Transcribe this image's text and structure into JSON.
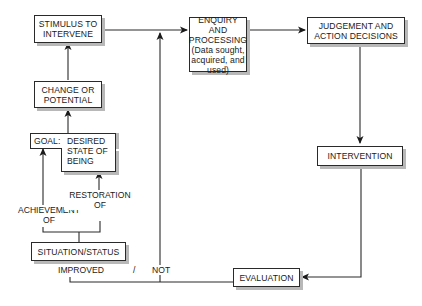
{
  "diagram": {
    "type": "flowchart",
    "nodes": {
      "stimulus": {
        "label": "STIMULUS TO\nINTERVENE"
      },
      "change": {
        "label": "CHANGE OR\nPOTENTIAL"
      },
      "goal": {
        "prefix": "GOAL:",
        "label": "DESIRED\nSTATE OF\nBEING"
      },
      "situation": {
        "label": "SITUATION/STATUS"
      },
      "enquiry": {
        "label": "ENQUIRY AND\nPROCESSING\n(Data sought,\nacquired, and\nused)"
      },
      "judgement": {
        "label": "JUDGEMENT  AND\nACTION DECISIONS"
      },
      "intervention": {
        "label": "INTERVENTION"
      },
      "evaluation": {
        "label": "EVALUATION"
      }
    },
    "edge_labels": {
      "achievement": "ACHIEVEMENT\nOF",
      "restoration": "RESTORATION\nOF",
      "improved": "IMPROVED",
      "slash": "/",
      "not": "NOT"
    },
    "edges": [
      {
        "from": "situation",
        "to": "goal",
        "label": "ACHIEVEMENT OF"
      },
      {
        "from": "situation",
        "to": "goal",
        "label": "RESTORATION OF"
      },
      {
        "from": "goal",
        "to": "change"
      },
      {
        "from": "change",
        "to": "stimulus"
      },
      {
        "from": "stimulus",
        "to": "enquiry"
      },
      {
        "from": "enquiry",
        "to": "judgement"
      },
      {
        "from": "judgement",
        "to": "intervention"
      },
      {
        "from": "intervention",
        "to": "evaluation"
      },
      {
        "from": "evaluation",
        "to": "situation",
        "label": "IMPROVED"
      },
      {
        "from": "evaluation",
        "to": "enquiry",
        "label": "NOT"
      }
    ],
    "colors": {
      "line": "#2a2a2a",
      "shadow": "#b8b8b8",
      "background": "#ffffff"
    }
  }
}
